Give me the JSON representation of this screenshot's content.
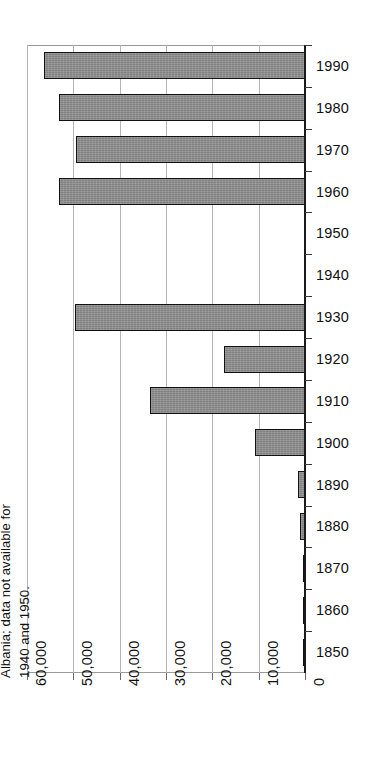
{
  "chart_data": {
    "type": "bar",
    "orientation": "horizontal",
    "title": "",
    "xlabel": "",
    "ylabel": "",
    "categories": [
      "1990",
      "1980",
      "1970",
      "1960",
      "1950",
      "1940",
      "1930",
      "1920",
      "1910",
      "1900",
      "1890",
      "1880",
      "1870",
      "1860",
      "1850"
    ],
    "values": [
      56300,
      53000,
      49400,
      53200,
      null,
      null,
      49600,
      17400,
      33400,
      10800,
      1500,
      1100,
      400,
      300,
      250
    ],
    "xlim": [
      0,
      60000
    ],
    "x_axis_reversed": true,
    "x_tick_labels": [
      "60,000",
      "50,000",
      "40,000",
      "30,000",
      "20,000",
      "10,000",
      "0"
    ],
    "x_tick_values": [
      60000,
      50000,
      40000,
      30000,
      20000,
      10000,
      0
    ],
    "grid": "vertical",
    "legend": "none",
    "bar_color": "#8c8c8c",
    "bar_border_color": "#111111",
    "grid_color": "#b5b5b5",
    "axis_color": "#1a1a1a",
    "text_color": "#101010",
    "annotations": [
      "Note: Figures based on country of birth; 1910 figures include Albania; data not available for 1940 and 1950."
    ]
  },
  "note": {
    "text": "Note: Figures based on country\nof birth; 1910 figures include\nAlbania; data not available for\n1940 and 1950."
  }
}
